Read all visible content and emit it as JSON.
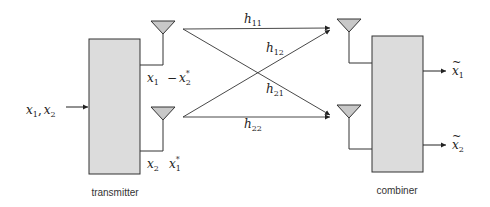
{
  "diagram": {
    "type": "2x2 MIMO Alamouti space-time coding block diagram",
    "transmitter": {
      "label": "transmitter",
      "input": {
        "symbol": "x",
        "sub1": "1",
        "comma": ",",
        "symbol2": "x",
        "sub2": "2"
      },
      "antenna1_signals": {
        "first": "x",
        "first_sub": "1",
        "second_prefix": "−",
        "second": "x",
        "second_sub": "2",
        "second_sup": "*"
      },
      "antenna2_signals": {
        "first": "x",
        "first_sub": "2",
        "second": "x",
        "second_sub": "1",
        "second_sup": "*"
      }
    },
    "channels": [
      {
        "id": "h11",
        "symbol": "h",
        "sub": "11"
      },
      {
        "id": "h12",
        "symbol": "h",
        "sub": "12"
      },
      {
        "id": "h21",
        "symbol": "h",
        "sub": "21"
      },
      {
        "id": "h22",
        "symbol": "h",
        "sub": "22"
      }
    ],
    "combiner": {
      "label": "combiner",
      "outputs": [
        {
          "symbol": "x",
          "accent": "~",
          "sub": "1"
        },
        {
          "symbol": "x",
          "accent": "~",
          "sub": "2"
        }
      ]
    },
    "colors": {
      "block_fill": "#dcdcdc",
      "antenna_fill": "#c8c8c8",
      "stroke": "#333333"
    }
  }
}
